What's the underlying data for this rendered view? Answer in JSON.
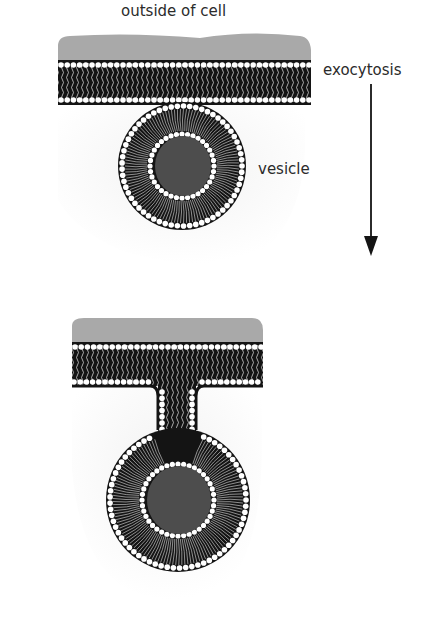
{
  "labels": {
    "outside": "outside of cell",
    "process": "exocytosis",
    "vesicle": "vesicle"
  },
  "colors": {
    "extracellular": "#a9a9a9",
    "membrane_dark": "#141414",
    "head": "#ffffff",
    "cargo": "#4d4d4d",
    "cytoplasm": "#f3f3f3",
    "text": "#2b2b2b"
  },
  "stages": [
    {
      "name": "vesicle approaching membrane"
    },
    {
      "name": "vesicle fused with membrane"
    }
  ]
}
